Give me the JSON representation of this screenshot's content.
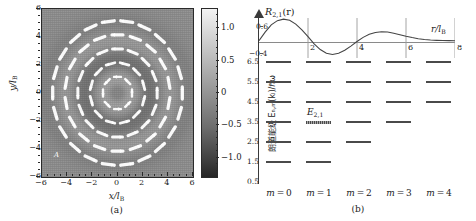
{
  "figure": {
    "panel_a": {
      "caption": "(a)",
      "xlabel_main": "x/l",
      "xlabel_sub": "B",
      "ylabel_main": "y/l",
      "ylabel_sub": "B",
      "xticks": [
        "−6",
        "−4",
        "−2",
        "0",
        "2",
        "4",
        "6"
      ],
      "xtick_values": [
        -6,
        -4,
        -2,
        0,
        2,
        4,
        6
      ],
      "yticks": [
        "6",
        "4",
        "2",
        "0",
        "−2",
        "−4",
        "−6"
      ],
      "ytick_values": [
        6,
        4,
        2,
        0,
        -2,
        -4,
        -6
      ],
      "xlim": [
        -6,
        6
      ],
      "ylim": [
        -6,
        6
      ],
      "inline_labels": [
        "A",
        "A"
      ],
      "colorbar": {
        "ticks": [
          "1.0",
          "0.5",
          "0",
          "−0.5",
          "−1.0"
        ],
        "tick_values": [
          1.0,
          0.5,
          0.0,
          -0.5,
          -1.0
        ],
        "vmin": -1.3,
        "vmax": 1.3
      }
    },
    "panel_b": {
      "caption": "(b)",
      "ylabel": "朗道能级 Eₙ,ₘ(kₗ)/ℏω",
      "yticks": [
        "6.5",
        "5.5",
        "4.5",
        "3.5",
        "2.5",
        "1.5",
        "0.5"
      ],
      "ytick_values": [
        6.5,
        5.5,
        4.5,
        3.5,
        2.5,
        1.5,
        0.5
      ],
      "m_labels": [
        "m = 0",
        "m = 1",
        "m = 2",
        "m = 3",
        "m = 4"
      ],
      "m_values": [
        0,
        1,
        2,
        3,
        4
      ],
      "levels": [
        {
          "energy": 6.5,
          "m": [
            0,
            1,
            2,
            3,
            4
          ]
        },
        {
          "energy": 5.5,
          "m": [
            0,
            1,
            2,
            3,
            4
          ]
        },
        {
          "energy": 4.5,
          "m": [
            0,
            1,
            2,
            3,
            4
          ]
        },
        {
          "energy": 3.5,
          "m": [
            0,
            1,
            2,
            3
          ]
        },
        {
          "energy": 2.5,
          "m": [
            0,
            1,
            2
          ]
        },
        {
          "energy": 1.5,
          "m": [
            0,
            1
          ]
        }
      ],
      "highlight": {
        "label_main": "E",
        "label_sub": "2,1",
        "energy": 3.5,
        "m": 1
      },
      "inset": {
        "title_main": "R",
        "title_sub": "2,1",
        "title_tail": "(r)",
        "xlabel_main": "r/l",
        "xlabel_sub": "B",
        "ytick_top": "0.6",
        "ytick_bottom": "−0.4",
        "ylim": [
          -0.4,
          0.6
        ],
        "xlim": [
          0,
          8
        ],
        "xticks": [
          "2",
          "4",
          "6",
          "8"
        ],
        "xtick_values": [
          2,
          4,
          6,
          8
        ]
      }
    }
  },
  "chart_data": [
    {
      "type": "heatmap",
      "title": "(a)",
      "xlabel": "x/l_B",
      "ylabel": "y/l_B",
      "xlim": [
        -6,
        6
      ],
      "ylim": [
        -6,
        6
      ],
      "grid": false,
      "colorbar_ticks": [
        1.0,
        0.5,
        0.0,
        -0.5,
        -1.0
      ],
      "colorbar_range": [
        -1.3,
        1.3
      ],
      "description": "Landau-level probability-density map with overlaid white current-density vector field forming concentric circulating rings",
      "radial_nodes": [
        0,
        1.9,
        4.3
      ],
      "annotations": [
        "A",
        "A"
      ]
    },
    {
      "type": "line",
      "title": "R_2,1(r)",
      "xlabel": "r/l_B",
      "ylabel": "R_2,1(r)",
      "xlim": [
        0,
        8
      ],
      "ylim": [
        -0.4,
        0.6
      ],
      "grid": true,
      "legend": "none",
      "x": [
        0.0,
        0.25,
        0.5,
        0.75,
        1.0,
        1.25,
        1.5,
        1.75,
        2.0,
        2.25,
        2.5,
        2.75,
        3.0,
        3.25,
        3.5,
        3.75,
        4.0,
        4.25,
        4.5,
        4.75,
        5.0,
        5.25,
        5.5,
        5.75,
        6.0,
        6.25,
        6.5,
        6.75,
        7.0,
        7.25,
        7.5,
        7.75,
        8.0
      ],
      "values": [
        0.0,
        0.23,
        0.42,
        0.53,
        0.57,
        0.54,
        0.44,
        0.29,
        0.11,
        -0.08,
        -0.23,
        -0.33,
        -0.36,
        -0.33,
        -0.25,
        -0.14,
        -0.02,
        0.09,
        0.17,
        0.22,
        0.24,
        0.23,
        0.2,
        0.16,
        0.12,
        0.085,
        0.055,
        0.035,
        0.02,
        0.012,
        0.007,
        0.004,
        0.002
      ],
      "xticks": [
        2,
        4,
        6,
        8
      ],
      "yticks": [
        -0.4,
        0.6
      ]
    },
    {
      "type": "scatter",
      "title": "(b)",
      "xlabel": "m",
      "ylabel": "朗道能级 E_n,m(k_z)/ℏω",
      "xlim": [
        -0.5,
        4.5
      ],
      "ylim": [
        0.5,
        6.8
      ],
      "grid": false,
      "categories": [
        "m = 0",
        "m = 1",
        "m = 2",
        "m = 3",
        "m = 4"
      ],
      "series": [
        {
          "name": "E = 6.5",
          "values": [
            6.5,
            6.5,
            6.5,
            6.5,
            6.5
          ]
        },
        {
          "name": "E = 5.5",
          "values": [
            5.5,
            5.5,
            5.5,
            5.5,
            5.5
          ]
        },
        {
          "name": "E = 4.5",
          "values": [
            4.5,
            4.5,
            4.5,
            4.5,
            4.5
          ]
        },
        {
          "name": "E = 3.5",
          "values": [
            3.5,
            3.5,
            3.5,
            3.5,
            null
          ]
        },
        {
          "name": "E = 2.5",
          "values": [
            2.5,
            2.5,
            2.5,
            null,
            null
          ]
        },
        {
          "name": "E = 1.5",
          "values": [
            1.5,
            1.5,
            null,
            null,
            null
          ]
        }
      ],
      "yticks": [
        0.5,
        1.5,
        2.5,
        3.5,
        4.5,
        5.5,
        6.5
      ],
      "annotations": [
        {
          "text": "E_2,1",
          "m": 1,
          "energy": 3.5
        }
      ]
    }
  ]
}
